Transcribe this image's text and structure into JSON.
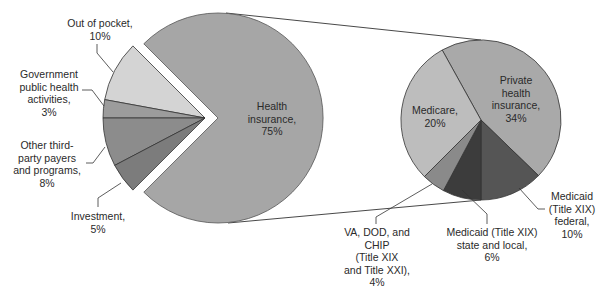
{
  "chart_data": [
    {
      "type": "pie",
      "title": "",
      "exploded": true,
      "slices": [
        {
          "label": "Health insurance",
          "value": 75,
          "color": "#a6a6a6"
        },
        {
          "label": "Out of pocket",
          "value": 10,
          "color": "#d4d4d4"
        },
        {
          "label": "Government public health activities",
          "value": 3,
          "color": "#9c9c9c"
        },
        {
          "label": "Other third-party payers and programs",
          "value": 8,
          "color": "#8c8c8c"
        },
        {
          "label": "Investment",
          "value": 5,
          "color": "#7c7c7c"
        }
      ]
    },
    {
      "type": "pie",
      "title": "Breakdown of Health insurance",
      "slices": [
        {
          "label": "Private health insurance",
          "value": 34,
          "color": "#a9a9a9"
        },
        {
          "label": "Medicaid (Title XIX) federal",
          "value": 10,
          "color": "#555555"
        },
        {
          "label": "Medicaid (Title XIX) state and local",
          "value": 6,
          "color": "#3c3c3c"
        },
        {
          "label": "VA, DOD, and CHIP (Title XIX and Title XXI)",
          "value": 4,
          "color": "#8a8a8a"
        },
        {
          "label": "Medicare",
          "value": 20,
          "color": "#bdbdbd"
        }
      ]
    }
  ],
  "labels": {
    "out_of_pocket": "Out of pocket,\n10%",
    "gov_public_health": "Government\npublic health\nactivities,\n3%",
    "other_third_party": "Other third-\nparty payers\nand programs,\n8%",
    "investment": "Investment,\n5%",
    "health_insurance": "Health\ninsurance,\n75%",
    "medicare": "Medicare,\n20%",
    "private": "Private\nhealth\ninsurance,\n34%",
    "medicaid_federal": "Medicaid\n(Title XIX)\nfederal,\n10%",
    "medicaid_state": "Medicaid (Title XIX)\nstate and local,\n6%",
    "va_dod_chip": "VA, DOD, and\nCHIP\n(Title XIX\nand Title XXI),\n4%"
  }
}
